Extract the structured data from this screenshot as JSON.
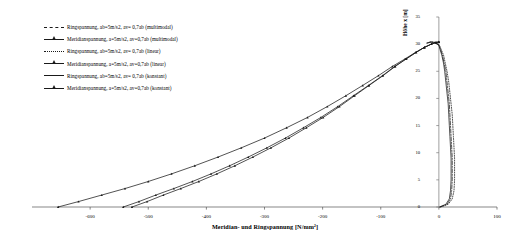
{
  "chart_data": {
    "type": "line",
    "title": "",
    "xlabel": "Meridian- und Ringspannung [N/mm²]",
    "ylabel": "Höhe x [m]",
    "xlim": [
      -700,
      100
    ],
    "ylim": [
      0,
      35
    ],
    "xticks": [
      -600,
      -500,
      -400,
      -300,
      -200,
      -100,
      0,
      100
    ],
    "xtick_labels": [
      "-600",
      "-500",
      "-400",
      "-300",
      "-200",
      "-100",
      "0",
      "100"
    ],
    "yticks": [
      0,
      5,
      10,
      15,
      20,
      25,
      30,
      35
    ],
    "ytick_labels": [
      "0",
      "5",
      "10",
      "15",
      "20",
      "25",
      "30",
      "35"
    ],
    "grid": false,
    "legend_position": "upper-left",
    "series": [
      {
        "name": "Ringspannung, ab=5m/s2, av= 0,7ab (multimodal)",
        "style": "dashdot",
        "marker": "none",
        "color": "#1a1a1a",
        "points": [
          [
            2,
            0
          ],
          [
            14,
            0.5
          ],
          [
            20,
            1.5
          ],
          [
            22,
            3
          ],
          [
            23,
            5
          ],
          [
            23,
            7
          ],
          [
            23,
            9
          ],
          [
            22,
            11
          ],
          [
            21,
            13
          ],
          [
            20,
            15
          ],
          [
            19,
            17
          ],
          [
            18,
            19
          ],
          [
            16,
            21
          ],
          [
            14,
            23
          ],
          [
            12,
            25
          ],
          [
            9,
            26.5
          ],
          [
            6,
            28
          ],
          [
            3,
            29
          ],
          [
            0,
            29.8
          ],
          [
            -6,
            30.3
          ],
          [
            -14,
            30.4
          ],
          [
            -20,
            30.2
          ]
        ]
      },
      {
        "name": "Meridianspannung, a=5m/s2, av=0,7ab (multimodal)",
        "style": "solid",
        "marker": "triangle",
        "color": "#1a1a1a",
        "points": [
          [
            -655,
            0
          ],
          [
            -620,
            1
          ],
          [
            -580,
            2.2
          ],
          [
            -540,
            3.4
          ],
          [
            -500,
            4.7
          ],
          [
            -460,
            6.1
          ],
          [
            -420,
            7.6
          ],
          [
            -380,
            9.2
          ],
          [
            -340,
            10.9
          ],
          [
            -300,
            12.7
          ],
          [
            -262,
            14.6
          ],
          [
            -226,
            16.5
          ],
          [
            -192,
            18.5
          ],
          [
            -160,
            20.5
          ],
          [
            -131,
            22.4
          ],
          [
            -104,
            24.2
          ],
          [
            -80,
            25.9
          ],
          [
            -58,
            27.3
          ],
          [
            -40,
            28.5
          ],
          [
            -25,
            29.4
          ],
          [
            -13,
            30.0
          ],
          [
            -5,
            30.3
          ],
          [
            0,
            30.4
          ]
        ]
      },
      {
        "name": "Ringspannung, ab=5m/s2, av= 0,7ab (linear)",
        "style": "dotted",
        "marker": "none",
        "color": "#1a1a1a",
        "points": [
          [
            3,
            0
          ],
          [
            16,
            0.5
          ],
          [
            23,
            1.5
          ],
          [
            26,
            3
          ],
          [
            27,
            5
          ],
          [
            27,
            7
          ],
          [
            27,
            9
          ],
          [
            26,
            11
          ],
          [
            25,
            13
          ],
          [
            24,
            15
          ],
          [
            23,
            17
          ],
          [
            21,
            19
          ],
          [
            19,
            21
          ],
          [
            17,
            23
          ],
          [
            14,
            25
          ],
          [
            11,
            26.5
          ],
          [
            8,
            28
          ],
          [
            4,
            29
          ],
          [
            1,
            29.8
          ],
          [
            -5,
            30.3
          ],
          [
            -13,
            30.4
          ],
          [
            -19,
            30.2
          ]
        ]
      },
      {
        "name": "Meridianspannung, a=5m/s2, av=0,7ab (linear)",
        "style": "solid",
        "marker": "triangle",
        "color": "#1a1a1a",
        "points": [
          [
            -543,
            0
          ],
          [
            -516,
            1
          ],
          [
            -487,
            2.2
          ],
          [
            -456,
            3.4
          ],
          [
            -424,
            4.7
          ],
          [
            -392,
            6.1
          ],
          [
            -360,
            7.6
          ],
          [
            -328,
            9.2
          ],
          [
            -296,
            10.9
          ],
          [
            -264,
            12.7
          ],
          [
            -233,
            14.6
          ],
          [
            -203,
            16.5
          ],
          [
            -174,
            18.5
          ],
          [
            -147,
            20.5
          ],
          [
            -121,
            22.4
          ],
          [
            -97,
            24.2
          ],
          [
            -76,
            25.9
          ],
          [
            -56,
            27.3
          ],
          [
            -39,
            28.5
          ],
          [
            -25,
            29.4
          ],
          [
            -13,
            30.0
          ],
          [
            -5,
            30.3
          ],
          [
            0,
            30.4
          ]
        ]
      },
      {
        "name": "Ringspannung, ab=5m/s2, av= 0,7ab (konstant)",
        "style": "solid",
        "marker": "none",
        "color": "#1a1a1a",
        "points": [
          [
            1,
            0
          ],
          [
            12,
            0.5
          ],
          [
            18,
            1.5
          ],
          [
            20,
            3
          ],
          [
            21,
            5
          ],
          [
            21,
            7
          ],
          [
            21,
            9
          ],
          [
            20,
            11
          ],
          [
            19,
            13
          ],
          [
            18,
            15
          ],
          [
            17,
            17
          ],
          [
            16,
            19
          ],
          [
            14,
            21
          ],
          [
            12,
            23
          ],
          [
            10,
            25
          ],
          [
            8,
            26.5
          ],
          [
            5,
            28
          ],
          [
            2,
            29
          ],
          [
            0,
            29.8
          ],
          [
            -7,
            30.3
          ],
          [
            -15,
            30.4
          ],
          [
            -21,
            30.2
          ]
        ]
      },
      {
        "name": "Meridianspannung, a=5m/s2, av=0,7ab (konstant)",
        "style": "solid",
        "marker": "triangle",
        "color": "#1a1a1a",
        "points": [
          [
            -528,
            0
          ],
          [
            -502,
            1
          ],
          [
            -474,
            2.2
          ],
          [
            -444,
            3.4
          ],
          [
            -413,
            4.7
          ],
          [
            -382,
            6.1
          ],
          [
            -351,
            7.6
          ],
          [
            -320,
            9.2
          ],
          [
            -289,
            10.9
          ],
          [
            -258,
            12.7
          ],
          [
            -228,
            14.6
          ],
          [
            -199,
            16.5
          ],
          [
            -171,
            18.5
          ],
          [
            -145,
            20.5
          ],
          [
            -120,
            22.4
          ],
          [
            -96,
            24.2
          ],
          [
            -75,
            25.9
          ],
          [
            -56,
            27.3
          ],
          [
            -39,
            28.5
          ],
          [
            -25,
            29.4
          ],
          [
            -13,
            30.0
          ],
          [
            -5,
            30.3
          ],
          [
            0,
            30.4
          ]
        ]
      }
    ]
  },
  "legend": {
    "items": [
      {
        "label": "Ringspannung, ab=5m/s2, av= 0,7ab (multimodal)",
        "style": "dashdot",
        "marker": "none"
      },
      {
        "label": "Meridianspannung, a=5m/s2, av=0,7ab (multimodal)",
        "style": "solid",
        "marker": "triangle"
      },
      {
        "label": "Ringspannung, ab=5m/s2, av= 0,7ab (linear)",
        "style": "dotted",
        "marker": "none"
      },
      {
        "label": "Meridianspannung, a=5m/s2, av=0,7ab (linear)",
        "style": "solid",
        "marker": "triangle"
      },
      {
        "label": "Ringspannung, ab=5m/s2, av= 0,7ab (konstant)",
        "style": "solid",
        "marker": "none"
      },
      {
        "label": "Meridianspannung, a=5m/s2, av=0,7ab (konstant)",
        "style": "solid",
        "marker": "triangle"
      }
    ]
  },
  "axes": {
    "x_title": "Meridian- und Ringspannung [N/mm²]",
    "y_title": "Höhe x [m]"
  }
}
